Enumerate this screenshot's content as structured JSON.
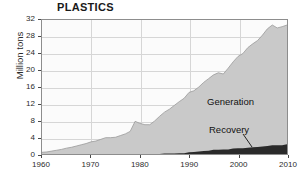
{
  "chart_data": {
    "type": "area",
    "stacked": true,
    "title": "PLASTICS",
    "xlabel": "",
    "ylabel": "Million tons",
    "xlim": [
      1960,
      2010
    ],
    "ylim": [
      0,
      32
    ],
    "grid": true,
    "legend_position": "inline-annotation",
    "x_ticks": [
      "1960",
      "1970",
      "1980",
      "1990",
      "2000",
      "2010"
    ],
    "y_ticks": [
      "0",
      "4",
      "8",
      "12",
      "16",
      "20",
      "24",
      "28",
      "32"
    ],
    "x": [
      1960,
      1961,
      1962,
      1963,
      1964,
      1965,
      1966,
      1967,
      1968,
      1969,
      1970,
      1971,
      1972,
      1973,
      1974,
      1975,
      1976,
      1977,
      1978,
      1979,
      1980,
      1981,
      1982,
      1983,
      1984,
      1985,
      1986,
      1987,
      1988,
      1989,
      1990,
      1991,
      1992,
      1993,
      1994,
      1995,
      1996,
      1997,
      1998,
      1999,
      2000,
      2001,
      2002,
      2003,
      2004,
      2005,
      2006,
      2007,
      2008,
      2009,
      2010
    ],
    "series": [
      {
        "name": "Generation",
        "color": "#c9c9c9",
        "values": [
          0.4,
          0.5,
          0.7,
          0.9,
          1.1,
          1.4,
          1.6,
          1.9,
          2.2,
          2.5,
          2.9,
          3.1,
          3.5,
          3.9,
          3.9,
          4.0,
          4.4,
          4.8,
          5.4,
          7.8,
          7.3,
          7.0,
          7.0,
          7.9,
          9.0,
          10.0,
          10.7,
          11.6,
          12.5,
          13.3,
          14.7,
          15.1,
          16.0,
          17.1,
          18.0,
          18.9,
          19.4,
          19.1,
          20.5,
          22.0,
          23.3,
          24.0,
          25.4,
          26.3,
          27.1,
          28.4,
          29.9,
          30.8,
          30.1,
          30.4,
          30.8
        ]
      },
      {
        "name": "Recovery",
        "color": "#2a2a2a",
        "values": [
          0.0,
          0.0,
          0.0,
          0.0,
          0.0,
          0.0,
          0.0,
          0.0,
          0.0,
          0.0,
          0.0,
          0.0,
          0.0,
          0.0,
          0.0,
          0.0,
          0.0,
          0.0,
          0.0,
          0.0,
          0.0,
          0.0,
          0.0,
          0.0,
          0.0,
          0.1,
          0.1,
          0.1,
          0.2,
          0.2,
          0.4,
          0.5,
          0.6,
          0.7,
          0.8,
          1.0,
          1.0,
          1.1,
          1.1,
          1.3,
          1.4,
          1.4,
          1.5,
          1.6,
          1.7,
          1.8,
          1.9,
          2.1,
          2.1,
          2.1,
          2.3
        ]
      }
    ],
    "annotations": [
      {
        "text": "Generation",
        "x": 2000,
        "y": 13
      },
      {
        "text": "Recovery",
        "x": 2000,
        "y": 5
      }
    ]
  },
  "footer": {
    "caption": ""
  },
  "colors": {
    "generation_fill": "#c9c9c9",
    "recovery_fill": "#2a2a2a",
    "plot_background": "#fbfbfb",
    "gridline": "#d6d6d6",
    "frame": "#8d8d8d",
    "text": "#2b2b2b"
  }
}
